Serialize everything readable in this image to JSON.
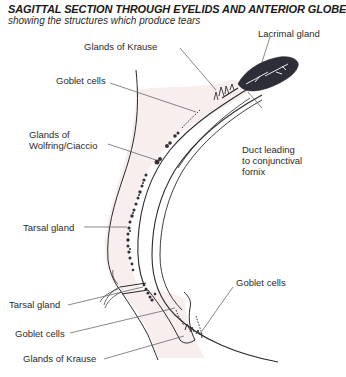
{
  "header": {
    "title": "SAGITTAL SECTION THROUGH EYELIDS AND ANTERIOR GLOBE",
    "subtitle": "showing the structures which produce tears"
  },
  "labels": {
    "lacrimal_gland": "Lacrimal gland",
    "glands_of_krause_upper": "Glands of Krause",
    "goblet_cells_upper": "Goblet cells",
    "glands_of_wolfring_line1": "Glands of",
    "glands_of_wolfring_line2": "Wolfring/Ciaccio",
    "duct_line1": "Duct leading",
    "duct_line2": "to conjunctival",
    "duct_line3": "fornix",
    "tarsal_gland_upper": "Tarsal gland",
    "tarsal_gland_lower": "Tarsal gland",
    "goblet_cells_right": "Goblet cells",
    "goblet_cells_lower": "Goblet cells",
    "glands_of_krause_lower": "Glands of Krause"
  },
  "colors": {
    "line": "#2a2a2a",
    "leader": "#555555",
    "lid_tint": "#f8eeee",
    "gland_dark": "#2e2e38",
    "text": "#2b2b2b"
  }
}
